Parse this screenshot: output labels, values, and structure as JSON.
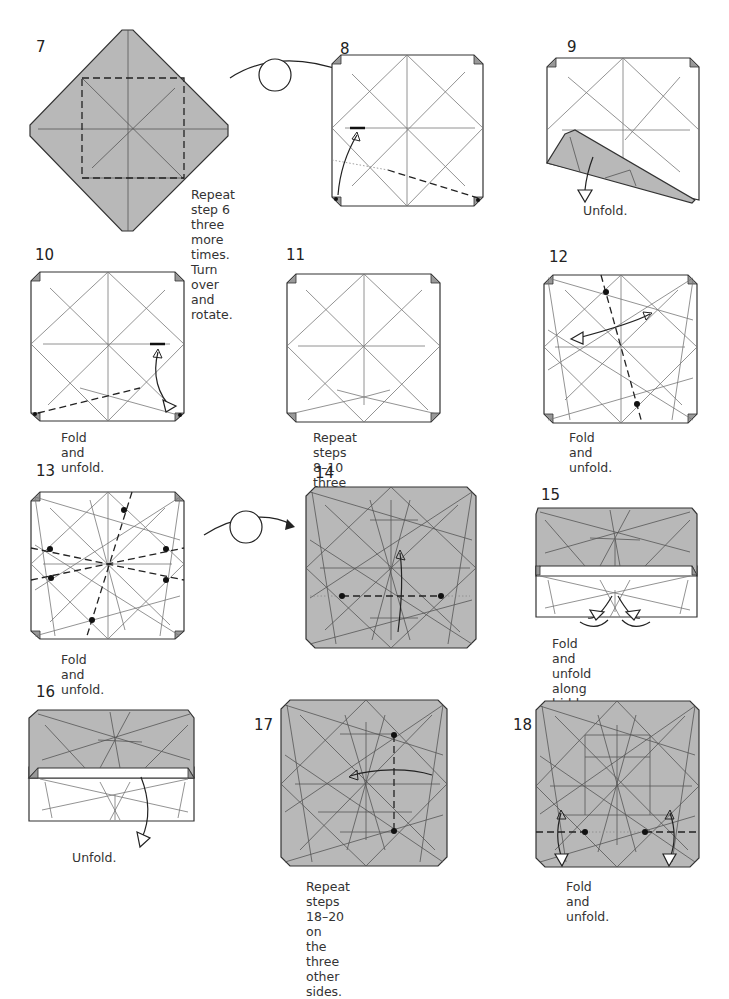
{
  "page": {
    "paper_colors": {
      "front": "#b8b8b8",
      "back": "#ffffff",
      "line": "#333333"
    },
    "steps": [
      {
        "number": "7",
        "caption": "Repeat step 6 three\nmore times. Turn\nover and rotate.",
        "symbols": [
          "valley-fold-lines",
          "turn-over-arrow"
        ]
      },
      {
        "number": "8",
        "caption": "",
        "symbols": [
          "valley-fold-line",
          "fold-arrow",
          "landmark-bar"
        ]
      },
      {
        "number": "9",
        "caption": "Unfold.",
        "symbols": [
          "unfold-arrow"
        ]
      },
      {
        "number": "10",
        "caption": "Fold and unfold.",
        "symbols": [
          "valley-fold-line",
          "fold-unfold-arrow",
          "landmark-bar"
        ]
      },
      {
        "number": "11",
        "caption": "Repeat steps 8–10\nthree more times.",
        "symbols": []
      },
      {
        "number": "12",
        "caption": "Fold and unfold.",
        "symbols": [
          "valley-fold-line",
          "fold-unfold-arrow",
          "reference-dots"
        ]
      },
      {
        "number": "13",
        "caption": "Fold and unfold.",
        "symbols": [
          "valley-fold-lines",
          "reference-dots",
          "turn-over-arrow"
        ]
      },
      {
        "number": "14",
        "caption": "",
        "symbols": [
          "valley-fold-line",
          "fold-arrow",
          "reference-dots"
        ]
      },
      {
        "number": "15",
        "caption": "Fold and unfold\nalong hidden creases.",
        "symbols": [
          "fold-unfold-arrows"
        ]
      },
      {
        "number": "16",
        "caption": "Unfold.",
        "symbols": [
          "unfold-arrow"
        ]
      },
      {
        "number": "17",
        "caption": "Repeat steps 18–20 on\nthe three other sides.",
        "symbols": [
          "valley-fold-line",
          "fold-arrow",
          "reference-dots"
        ]
      },
      {
        "number": "18",
        "caption": "Fold and unfold.",
        "symbols": [
          "valley-fold-line",
          "fold-unfold-arrows",
          "reference-dots"
        ]
      }
    ]
  }
}
